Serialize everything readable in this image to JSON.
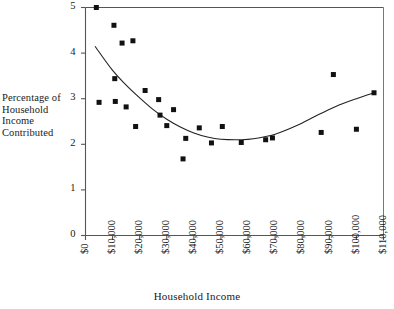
{
  "chart_data": {
    "type": "scatter",
    "title": "",
    "xlabel": "Household Income",
    "ylabel": "Percentage of Household Income Contributed",
    "ylabel_lines": [
      "Percentage of",
      "Household",
      "Income",
      "Contributed"
    ],
    "xlim": [
      0,
      110000
    ],
    "ylim": [
      0,
      5
    ],
    "grid": false,
    "legend": null,
    "xtick_labels": [
      "$0",
      "$10,000",
      "$20,000",
      "$30,000",
      "$40,000",
      "$50,000",
      "$60,000",
      "$70,000",
      "$80,000",
      "$90,000",
      "$100,000",
      "$110,000"
    ],
    "xtick_values": [
      0,
      10000,
      20000,
      30000,
      40000,
      50000,
      60000,
      70000,
      80000,
      90000,
      100000,
      110000
    ],
    "ytick_labels": [
      "0",
      "1",
      "2",
      "3",
      "4",
      "5"
    ],
    "ytick_values": [
      0,
      1,
      2,
      3,
      4,
      5
    ],
    "marker": {
      "shape": "square",
      "color": "#111111",
      "size": 5
    },
    "points": [
      {
        "x": 4000,
        "y": 5.0
      },
      {
        "x": 5000,
        "y": 2.92
      },
      {
        "x": 10500,
        "y": 4.61
      },
      {
        "x": 10800,
        "y": 3.44
      },
      {
        "x": 11000,
        "y": 2.94
      },
      {
        "x": 13500,
        "y": 4.22
      },
      {
        "x": 15000,
        "y": 2.82
      },
      {
        "x": 17500,
        "y": 4.27
      },
      {
        "x": 18500,
        "y": 2.39
      },
      {
        "x": 22000,
        "y": 3.18
      },
      {
        "x": 27000,
        "y": 2.98
      },
      {
        "x": 27500,
        "y": 2.64
      },
      {
        "x": 30000,
        "y": 2.41
      },
      {
        "x": 32500,
        "y": 2.76
      },
      {
        "x": 36000,
        "y": 1.68
      },
      {
        "x": 37000,
        "y": 2.13
      },
      {
        "x": 42000,
        "y": 2.36
      },
      {
        "x": 46500,
        "y": 2.03
      },
      {
        "x": 50500,
        "y": 2.39
      },
      {
        "x": 57500,
        "y": 2.04
      },
      {
        "x": 66500,
        "y": 2.1
      },
      {
        "x": 69000,
        "y": 2.14
      },
      {
        "x": 87000,
        "y": 2.26
      },
      {
        "x": 91500,
        "y": 3.53
      },
      {
        "x": 100000,
        "y": 2.33
      },
      {
        "x": 106500,
        "y": 3.13
      }
    ],
    "fit_curve": {
      "label": "fitted quadratic trend",
      "color": "#222222",
      "x_start": 3500,
      "x_end": 107000,
      "minimum": {
        "x": 57000,
        "y": 2.1
      },
      "sample_points": [
        {
          "x": 3500,
          "y": 4.15
        },
        {
          "x": 10000,
          "y": 3.62
        },
        {
          "x": 15000,
          "y": 3.3
        },
        {
          "x": 20000,
          "y": 3.02
        },
        {
          "x": 25000,
          "y": 2.76
        },
        {
          "x": 30000,
          "y": 2.55
        },
        {
          "x": 35000,
          "y": 2.38
        },
        {
          "x": 40000,
          "y": 2.25
        },
        {
          "x": 45000,
          "y": 2.16
        },
        {
          "x": 50000,
          "y": 2.11
        },
        {
          "x": 57000,
          "y": 2.1
        },
        {
          "x": 62000,
          "y": 2.12
        },
        {
          "x": 70000,
          "y": 2.22
        },
        {
          "x": 78000,
          "y": 2.41
        },
        {
          "x": 85000,
          "y": 2.62
        },
        {
          "x": 92000,
          "y": 2.82
        },
        {
          "x": 100000,
          "y": 3.0
        },
        {
          "x": 107000,
          "y": 3.14
        }
      ]
    }
  }
}
